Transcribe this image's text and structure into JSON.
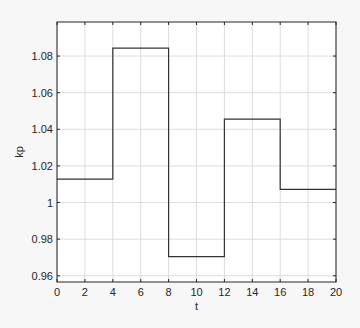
{
  "chart_data": {
    "type": "line",
    "subtype": "stairs",
    "title": "",
    "xlabel": "t",
    "ylabel": "kp",
    "xlim": [
      0,
      20
    ],
    "ylim": [
      0.9566,
      1.0986
    ],
    "x_ticks": [
      0,
      2,
      4,
      6,
      8,
      10,
      12,
      14,
      16,
      18,
      20
    ],
    "x_tick_labels": [
      "0",
      "2",
      "4",
      "6",
      "8",
      "10",
      "12",
      "14",
      "16",
      "18",
      "20"
    ],
    "y_ticks": [
      0.96,
      0.98,
      1.0,
      1.02,
      1.04,
      1.06,
      1.08
    ],
    "y_tick_labels": [
      "0.96",
      "0.98",
      "1",
      "1.02",
      "1.04",
      "1.06",
      "1.08"
    ],
    "grid": true,
    "legend": null,
    "series": [
      {
        "name": "kp",
        "color": "#333333",
        "x": [
          0,
          4,
          4,
          8,
          8,
          12,
          12,
          16,
          16,
          20
        ],
        "y": [
          1.0128,
          1.0128,
          1.0843,
          1.0843,
          0.9704,
          0.9704,
          1.0455,
          1.0455,
          1.0072,
          1.0072
        ]
      }
    ],
    "steps": [
      {
        "t_start": 0,
        "t_end": 4,
        "value": 1.0128
      },
      {
        "t_start": 4,
        "t_end": 8,
        "value": 1.0843
      },
      {
        "t_start": 8,
        "t_end": 12,
        "value": 0.9704
      },
      {
        "t_start": 12,
        "t_end": 16,
        "value": 1.0455
      },
      {
        "t_start": 16,
        "t_end": 20,
        "value": 1.0072
      }
    ]
  },
  "colors": {
    "background": "#f7f7f7",
    "plot_area": "#ffffff",
    "grid": "#dcdcdc",
    "axis": "#262626",
    "line": "#333333"
  }
}
